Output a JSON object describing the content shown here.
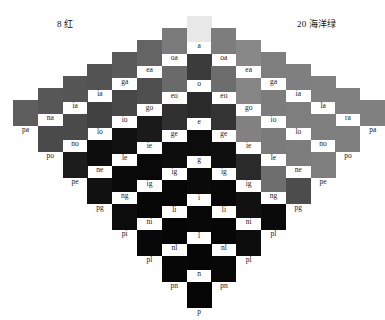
{
  "titles": {
    "left": "8 红",
    "right": "20 海洋绿"
  },
  "chart_data": {
    "type": "heatmap",
    "subtitle": "",
    "xlabel": "",
    "ylabel": "",
    "grid": false,
    "legend": "none",
    "layout": "symmetric diamond of color swatches, 15 columns, each column vertically centered",
    "columns": [
      {
        "index": 1,
        "x": 14,
        "top": 100,
        "cells": [
          {
            "label": "pa",
            "color": "#5e5e5e"
          }
        ]
      },
      {
        "index": 2,
        "x": 45,
        "top": 88,
        "cells": [
          {
            "label": "na",
            "color": "#575757"
          },
          {
            "label": "po",
            "color": "#4a4a4a"
          }
        ]
      },
      {
        "index": 3,
        "x": 76,
        "top": 76,
        "cells": [
          {
            "label": "ia",
            "color": "#565656"
          },
          {
            "label": "no",
            "color": "#4b4b4b"
          },
          {
            "label": "pe",
            "color": "#1c1c1c"
          }
        ]
      },
      {
        "index": 4,
        "x": 107,
        "top": 64,
        "cells": [
          {
            "label": "ia",
            "color": "#535353"
          },
          {
            "label": "lo",
            "color": "#414141"
          },
          {
            "label": "ne",
            "color": "#0d0d0d"
          },
          {
            "label": "pg",
            "color": "#111111"
          }
        ]
      },
      {
        "index": 5,
        "x": 138,
        "top": 52,
        "cells": [
          {
            "label": "ga",
            "color": "#5a5a5a"
          },
          {
            "label": "io",
            "color": "#484848"
          },
          {
            "label": "le",
            "color": "#101010"
          },
          {
            "label": "ng",
            "color": "#0a0a0a"
          },
          {
            "label": "pi",
            "color": "#0c0c0c"
          }
        ]
      },
      {
        "index": 6,
        "x": 169,
        "top": 40,
        "cells": [
          {
            "label": "ea",
            "color": "#646464"
          },
          {
            "label": "go",
            "color": "#4f4f4f"
          },
          {
            "label": "ie",
            "color": "#1a1a1a"
          },
          {
            "label": "ig",
            "color": "#090909"
          },
          {
            "label": "ni",
            "color": "#070707"
          },
          {
            "label": "pl",
            "color": "#080808"
          }
        ]
      },
      {
        "index": 7,
        "x": 200,
        "top": 28,
        "cells": [
          {
            "label": "oa",
            "color": "#7a7a7a"
          },
          {
            "label": "eo",
            "color": "#6a6a6a"
          },
          {
            "label": "ge",
            "color": "#303030"
          },
          {
            "label": "ig",
            "color": "#0d0d0d"
          },
          {
            "label": "li",
            "color": "#070707"
          },
          {
            "label": "nl",
            "color": "#060606"
          },
          {
            "label": "pn",
            "color": "#070707"
          }
        ]
      },
      {
        "index": 8,
        "x": 231,
        "top": 16,
        "cells": [
          {
            "label": "a",
            "color": "#e8e8e8"
          },
          {
            "label": "o",
            "color": "#3b3b3b"
          },
          {
            "label": "e",
            "color": "#2b2b2b"
          },
          {
            "label": "g",
            "color": "#0c0c0c"
          },
          {
            "label": "i",
            "color": "#0a0a0a"
          },
          {
            "label": "l",
            "color": "#080808"
          },
          {
            "label": "n",
            "color": "#060606"
          },
          {
            "label": "p",
            "color": "#050505"
          }
        ]
      },
      {
        "index": 9,
        "x": 262,
        "top": 28,
        "cells": [
          {
            "label": "oa",
            "color": "#7d7d7d"
          },
          {
            "label": "eo",
            "color": "#6d6d6d"
          },
          {
            "label": "ge",
            "color": "#343434"
          },
          {
            "label": "ig",
            "color": "#0f0f0f"
          },
          {
            "label": "li",
            "color": "#080808"
          },
          {
            "label": "nl",
            "color": "#070707"
          },
          {
            "label": "pn",
            "color": "#080808"
          }
        ]
      },
      {
        "index": 10,
        "x": 293,
        "top": 40,
        "cells": [
          {
            "label": "ea",
            "color": "#888888"
          },
          {
            "label": "go",
            "color": "#858585"
          },
          {
            "label": "ie",
            "color": "#828282"
          },
          {
            "label": "ig",
            "color": "#2a2a2a"
          },
          {
            "label": "ni",
            "color": "#111111"
          },
          {
            "label": "pl",
            "color": "#0c0c0c"
          }
        ]
      },
      {
        "index": 11,
        "x": 324,
        "top": 52,
        "cells": [
          {
            "label": "ga",
            "color": "#7e7e7e"
          },
          {
            "label": "io",
            "color": "#7c7c7c"
          },
          {
            "label": "le",
            "color": "#7b7b7b"
          },
          {
            "label": "ng",
            "color": "#6e6e6e"
          },
          {
            "label": "pl",
            "color": "#0a0a0a"
          }
        ]
      },
      {
        "index": 12,
        "x": 355,
        "top": 64,
        "cells": [
          {
            "label": "ia",
            "color": "#7f7f7f"
          },
          {
            "label": "lo",
            "color": "#7e7e7e"
          },
          {
            "label": "ne",
            "color": "#7d7d7d"
          },
          {
            "label": "pg",
            "color": "#4c4c4c"
          }
        ]
      },
      {
        "index": 13,
        "x": 386,
        "top": 76,
        "cells": [
          {
            "label": "la",
            "color": "#808080"
          },
          {
            "label": "no",
            "color": "#7f7f7f"
          },
          {
            "label": "pe",
            "color": "#7e7e7e"
          }
        ]
      },
      {
        "index": 14,
        "x": 417,
        "top": 88,
        "cells": [
          {
            "label": "ra",
            "color": "#808080"
          },
          {
            "label": "po",
            "color": "#7f7f7f"
          }
        ]
      },
      {
        "index": 15,
        "x": 448,
        "top": 100,
        "cells": [
          {
            "label": "pa",
            "color": "#808080"
          }
        ]
      }
    ]
  }
}
